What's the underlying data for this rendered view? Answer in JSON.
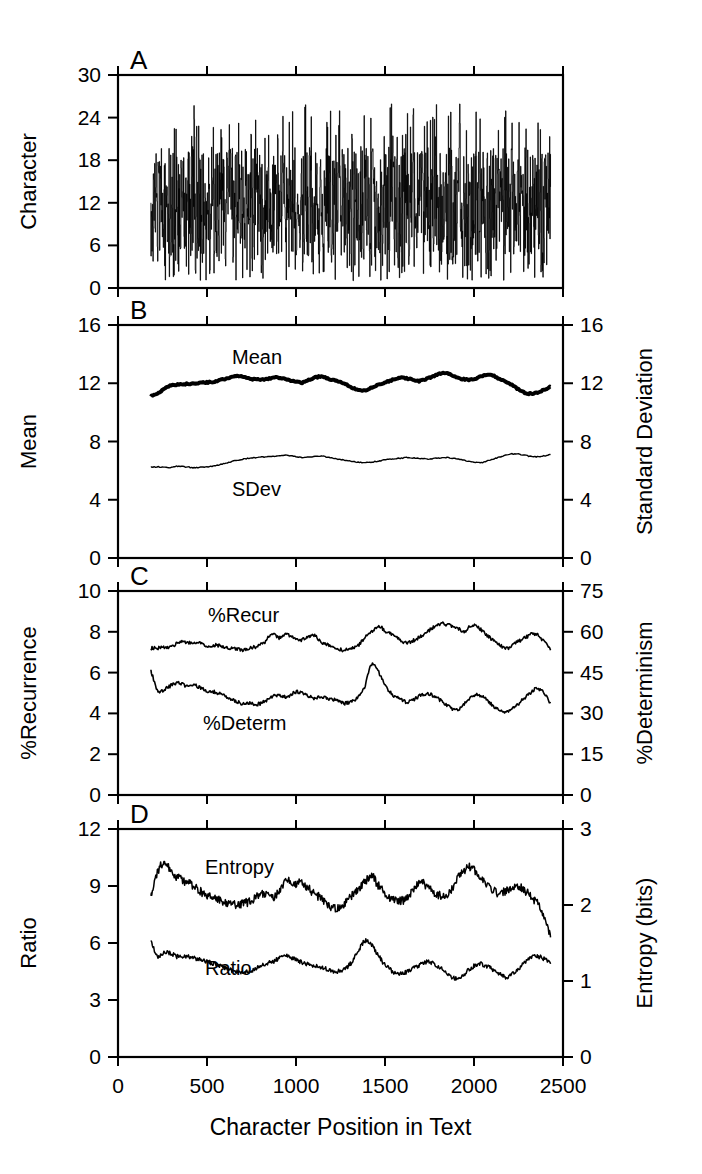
{
  "figure": {
    "title": "",
    "xaxis": {
      "label": "Character Position in Text",
      "ticks": [
        0,
        500,
        1000,
        1500,
        2000,
        2500
      ],
      "tick_labels": [
        "0",
        "500",
        "1000",
        "1500",
        "2000",
        "2500"
      ],
      "min": 0,
      "max": 2500
    },
    "panels": [
      {
        "id": "A",
        "label": "A",
        "left_axis_label": "Character",
        "left_ticks": [
          0,
          6,
          12,
          18,
          24,
          30
        ],
        "left_tick_labels": [
          "0",
          "6",
          "12",
          "18",
          "24",
          "30"
        ],
        "left_min": 0,
        "left_max": 30,
        "right_axis_label": "",
        "right_ticks": [],
        "right_tick_labels": [],
        "series_labels": []
      },
      {
        "id": "B",
        "label": "B",
        "left_axis_label": "Mean",
        "left_ticks": [
          0,
          4,
          8,
          12,
          16
        ],
        "left_tick_labels": [
          "0",
          "4",
          "8",
          "12",
          "16"
        ],
        "left_min": 0,
        "left_max": 16,
        "right_axis_label": "Standard Deviation",
        "right_ticks": [
          0,
          4,
          8,
          12,
          16
        ],
        "right_tick_labels": [
          "0",
          "4",
          "8",
          "12",
          "16"
        ],
        "right_min": 0,
        "right_max": 16,
        "series_labels": [
          "Mean",
          "SDev"
        ]
      },
      {
        "id": "C",
        "label": "C",
        "left_axis_label": "%Recurrence",
        "left_ticks": [
          0,
          2,
          4,
          6,
          8,
          10
        ],
        "left_tick_labels": [
          "0",
          "2",
          "4",
          "6",
          "8",
          "10"
        ],
        "left_min": 0,
        "left_max": 10,
        "right_axis_label": "%Determinism",
        "right_ticks": [
          0,
          15,
          30,
          45,
          60,
          75
        ],
        "right_tick_labels": [
          "0",
          "15",
          "30",
          "45",
          "60",
          "75"
        ],
        "right_min": 0,
        "right_max": 75,
        "series_labels": [
          "%Recur",
          "%Determ"
        ]
      },
      {
        "id": "D",
        "label": "D",
        "left_axis_label": "Ratio",
        "left_ticks": [
          0,
          3,
          6,
          9,
          12
        ],
        "left_tick_labels": [
          "0",
          "3",
          "6",
          "9",
          "12"
        ],
        "left_min": 0,
        "left_max": 12,
        "right_axis_label": "Entropy (bits)",
        "right_ticks": [
          0,
          1,
          2,
          3
        ],
        "right_tick_labels": [
          "0",
          "1",
          "2",
          "3"
        ],
        "right_min": 0,
        "right_max": 3,
        "series_labels": [
          "Entropy",
          "Ratio"
        ]
      }
    ]
  },
  "chart_data": [
    {
      "type": "line",
      "panel": "A",
      "title": "",
      "xlabel": "",
      "ylabel": "Character",
      "xlim": [
        0,
        2500
      ],
      "ylim": [
        0,
        30
      ],
      "grid": false,
      "legend": "none",
      "description": "Dense high-frequency symbolic time series of character codes (1-26) plotted versus character position; appears as a solid black band with spikes between 0 and 26.",
      "x_start": 185,
      "x_end": 2430,
      "series": [
        {
          "name": "Character",
          "style": "dense-vertical-lines",
          "value_range": [
            1,
            26
          ],
          "typical_band": [
            4,
            20
          ],
          "mean_level": 12
        }
      ]
    },
    {
      "type": "line",
      "panel": "B",
      "title": "",
      "xlabel": "",
      "ylabel": "Mean",
      "y2label": "Standard Deviation",
      "xlim": [
        0,
        2500
      ],
      "ylim": [
        0,
        16
      ],
      "y2lim": [
        0,
        16
      ],
      "grid": false,
      "legend": "inline-labels",
      "x_start": 185,
      "x_end": 2430,
      "x": [
        185,
        235,
        285,
        335,
        385,
        435,
        485,
        535,
        585,
        635,
        685,
        735,
        785,
        835,
        885,
        935,
        985,
        1035,
        1085,
        1135,
        1185,
        1235,
        1285,
        1335,
        1385,
        1435,
        1485,
        1535,
        1585,
        1635,
        1685,
        1735,
        1785,
        1835,
        1885,
        1935,
        1985,
        2035,
        2085,
        2135,
        2185,
        2235,
        2285,
        2335,
        2385,
        2430
      ],
      "series": [
        {
          "name": "Mean",
          "axis": "left",
          "linewidth": "thick",
          "values": [
            11.1,
            11.4,
            11.8,
            11.9,
            11.95,
            12.0,
            12.05,
            12.1,
            12.25,
            12.4,
            12.5,
            12.35,
            12.25,
            12.3,
            12.4,
            12.3,
            12.15,
            12.05,
            12.3,
            12.45,
            12.3,
            12.15,
            11.9,
            11.6,
            11.5,
            11.75,
            12.0,
            12.2,
            12.4,
            12.3,
            12.15,
            12.3,
            12.55,
            12.7,
            12.5,
            12.3,
            12.25,
            12.45,
            12.6,
            12.35,
            12.1,
            11.7,
            11.35,
            11.3,
            11.5,
            11.75
          ]
        },
        {
          "name": "SDev",
          "axis": "right",
          "linewidth": "thin",
          "values": [
            6.25,
            6.25,
            6.2,
            6.3,
            6.25,
            6.2,
            6.25,
            6.3,
            6.45,
            6.6,
            6.75,
            6.85,
            6.9,
            6.95,
            7.0,
            7.05,
            7.0,
            6.9,
            6.95,
            7.0,
            6.9,
            6.8,
            6.7,
            6.6,
            6.55,
            6.6,
            6.7,
            6.8,
            6.85,
            6.9,
            6.85,
            6.8,
            6.85,
            6.9,
            6.85,
            6.75,
            6.6,
            6.55,
            6.7,
            6.9,
            7.1,
            7.15,
            7.05,
            6.95,
            7.0,
            7.1
          ]
        }
      ]
    },
    {
      "type": "line",
      "panel": "C",
      "title": "",
      "xlabel": "",
      "ylabel": "%Recurrence",
      "y2label": "%Determinism",
      "xlim": [
        0,
        2500
      ],
      "ylim": [
        0,
        10
      ],
      "y2lim": [
        0,
        75
      ],
      "grid": false,
      "legend": "inline-labels",
      "x_start": 185,
      "x_end": 2430,
      "x": [
        185,
        225,
        265,
        305,
        345,
        385,
        425,
        465,
        505,
        545,
        585,
        625,
        665,
        705,
        745,
        785,
        825,
        865,
        905,
        945,
        985,
        1025,
        1065,
        1105,
        1145,
        1185,
        1225,
        1265,
        1305,
        1345,
        1385,
        1425,
        1465,
        1505,
        1545,
        1585,
        1625,
        1665,
        1705,
        1745,
        1785,
        1825,
        1865,
        1905,
        1945,
        1985,
        2025,
        2065,
        2105,
        2145,
        2185,
        2225,
        2265,
        2305,
        2345,
        2385,
        2430
      ],
      "series": [
        {
          "name": "%Recur",
          "axis": "left",
          "linewidth": "thin",
          "values": [
            7.2,
            7.2,
            7.25,
            7.3,
            7.5,
            7.45,
            7.5,
            7.45,
            7.3,
            7.35,
            7.3,
            7.2,
            7.15,
            7.1,
            7.2,
            7.3,
            7.5,
            7.9,
            7.7,
            7.85,
            7.7,
            7.6,
            7.75,
            7.8,
            7.5,
            7.35,
            7.2,
            7.1,
            7.15,
            7.3,
            7.7,
            8.0,
            8.3,
            8.0,
            7.85,
            7.6,
            7.45,
            7.6,
            7.8,
            8.05,
            8.3,
            8.4,
            8.3,
            8.2,
            8.0,
            8.3,
            8.2,
            7.9,
            7.6,
            7.35,
            7.2,
            7.4,
            7.6,
            7.8,
            7.9,
            7.6,
            7.1
          ]
        },
        {
          "name": "%Determ",
          "axis": "right",
          "linewidth": "thin",
          "values": [
            6.1,
            5.1,
            5.2,
            5.4,
            5.5,
            5.35,
            5.4,
            5.25,
            5.1,
            5.05,
            4.9,
            4.75,
            4.6,
            4.45,
            4.5,
            4.45,
            4.6,
            4.8,
            4.9,
            4.8,
            5.0,
            5.05,
            4.85,
            4.75,
            4.8,
            4.7,
            4.65,
            4.5,
            4.55,
            4.8,
            5.3,
            6.4,
            6.0,
            5.3,
            4.9,
            4.7,
            4.55,
            4.7,
            4.9,
            4.95,
            4.8,
            4.55,
            4.3,
            4.15,
            4.45,
            4.8,
            4.9,
            4.7,
            4.4,
            4.15,
            4.1,
            4.3,
            4.6,
            4.9,
            5.2,
            5.1,
            4.5
          ]
        }
      ]
    },
    {
      "type": "line",
      "panel": "D",
      "title": "",
      "xlabel": "Character Position in Text",
      "ylabel": "Ratio",
      "y2label": "Entropy (bits)",
      "xlim": [
        0,
        2500
      ],
      "ylim": [
        0,
        12
      ],
      "y2lim": [
        0,
        3
      ],
      "grid": false,
      "legend": "inline-labels",
      "x_start": 185,
      "x_end": 2430,
      "x": [
        185,
        225,
        265,
        305,
        345,
        385,
        425,
        465,
        505,
        545,
        585,
        625,
        665,
        705,
        745,
        785,
        825,
        865,
        905,
        945,
        985,
        1025,
        1065,
        1105,
        1145,
        1185,
        1225,
        1265,
        1305,
        1345,
        1385,
        1425,
        1465,
        1505,
        1545,
        1585,
        1625,
        1665,
        1705,
        1745,
        1785,
        1825,
        1865,
        1905,
        1945,
        1985,
        2025,
        2065,
        2105,
        2145,
        2185,
        2225,
        2265,
        2305,
        2345,
        2385,
        2430
      ],
      "series": [
        {
          "name": "Entropy",
          "axis": "right",
          "units": "bits",
          "linewidth": "thin",
          "noise": "high",
          "values_on_left_scale": [
            8.5,
            9.8,
            10.2,
            9.6,
            9.4,
            9.2,
            9.0,
            8.7,
            8.5,
            8.3,
            8.2,
            8.1,
            8.0,
            8.1,
            8.2,
            8.5,
            8.6,
            8.4,
            8.7,
            9.3,
            9.0,
            9.2,
            8.9,
            8.6,
            8.3,
            8.0,
            7.8,
            8.0,
            8.4,
            8.8,
            9.2,
            9.5,
            9.0,
            8.6,
            8.3,
            8.2,
            8.4,
            8.9,
            9.2,
            8.9,
            8.6,
            8.5,
            8.7,
            9.4,
            9.8,
            10.0,
            9.5,
            9.1,
            8.8,
            8.6,
            8.8,
            9.0,
            8.9,
            8.6,
            8.2,
            7.6,
            6.3
          ],
          "values_bits": [
            2.13,
            2.45,
            2.55,
            2.4,
            2.35,
            2.3,
            2.25,
            2.18,
            2.13,
            2.08,
            2.05,
            2.03,
            2.0,
            2.03,
            2.05,
            2.13,
            2.15,
            2.1,
            2.18,
            2.33,
            2.25,
            2.3,
            2.23,
            2.15,
            2.08,
            2.0,
            1.95,
            2.0,
            2.1,
            2.2,
            2.3,
            2.38,
            2.25,
            2.15,
            2.08,
            2.05,
            2.1,
            2.23,
            2.3,
            2.23,
            2.15,
            2.13,
            2.18,
            2.35,
            2.45,
            2.5,
            2.38,
            2.28,
            2.2,
            2.15,
            2.2,
            2.25,
            2.23,
            2.15,
            2.05,
            1.9,
            1.58
          ]
        },
        {
          "name": "Ratio",
          "axis": "left",
          "linewidth": "thin",
          "noise": "medium",
          "values": [
            6.1,
            5.3,
            5.5,
            5.4,
            5.25,
            5.3,
            5.2,
            5.15,
            5.0,
            4.9,
            4.75,
            4.6,
            4.5,
            4.45,
            4.55,
            4.7,
            4.9,
            5.0,
            5.2,
            5.3,
            5.2,
            5.0,
            4.9,
            4.8,
            4.7,
            4.6,
            4.5,
            4.6,
            4.9,
            5.5,
            6.1,
            5.9,
            5.3,
            4.8,
            4.5,
            4.4,
            4.5,
            4.7,
            4.9,
            5.0,
            4.85,
            4.6,
            4.3,
            4.1,
            4.35,
            4.7,
            4.9,
            4.8,
            4.6,
            4.35,
            4.2,
            4.45,
            4.8,
            5.1,
            5.3,
            5.2,
            4.9
          ]
        }
      ]
    }
  ]
}
